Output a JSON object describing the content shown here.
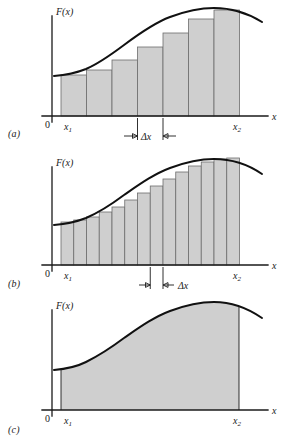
{
  "figure": {
    "background_color": "#ffffff",
    "curve_color": "#111111",
    "fill_color": "#cfcfcf",
    "bar_edge_color": "#6d6d6d",
    "axis_color": "#1a1a1a"
  },
  "labels": {
    "y_axis": "F(x)",
    "x_axis": "x",
    "origin": "0",
    "x_lower": "x",
    "x_lower_sub": "1",
    "x_upper": "x",
    "x_upper_sub": "2",
    "delta": "Δx",
    "panel_a": "(a)",
    "panel_b": "(b)",
    "panel_c": "(c)"
  },
  "panels": [
    {
      "id": "a",
      "letter": "(a)",
      "kind": "bar",
      "caption_label": "(a)",
      "bar_count": 7,
      "annotation": "Δx",
      "annotation_style": "outward-arrows-around-label",
      "note": "coarse left-endpoint rectangles under F(x)"
    },
    {
      "id": "b",
      "letter": "(b)",
      "kind": "bar",
      "caption_label": "(b)",
      "bar_count": 14,
      "annotation": "Δx",
      "annotation_style": "inward-arrows-label-right",
      "note": "finer left-endpoint rectangles under F(x)"
    },
    {
      "id": "c",
      "letter": "(c)",
      "kind": "area",
      "caption_label": "(c)",
      "bar_count": 0,
      "annotation": "",
      "annotation_style": "none",
      "note": "exact shaded area under F(x) between x1 and x2"
    }
  ],
  "chart_data": {
    "type": "area",
    "title": "",
    "xlabel": "x",
    "ylabel": "F(x)",
    "xlim": [
      0,
      1
    ],
    "ylim": [
      0,
      1
    ],
    "grid": false,
    "legend": "none",
    "x1": 0.155,
    "x2": 0.865,
    "curve_description": "smooth S-shaped rise from a low plateau to a broad maximum near x=0.80, then a slight decline",
    "curve_points_normalized": [
      {
        "x": 0.085,
        "y": 0.315
      },
      {
        "x": 0.155,
        "y": 0.32
      },
      {
        "x": 0.23,
        "y": 0.345
      },
      {
        "x": 0.3,
        "y": 0.405
      },
      {
        "x": 0.375,
        "y": 0.49
      },
      {
        "x": 0.45,
        "y": 0.585
      },
      {
        "x": 0.525,
        "y": 0.685
      },
      {
        "x": 0.6,
        "y": 0.78
      },
      {
        "x": 0.675,
        "y": 0.86
      },
      {
        "x": 0.75,
        "y": 0.915
      },
      {
        "x": 0.81,
        "y": 0.935
      },
      {
        "x": 0.865,
        "y": 0.925
      },
      {
        "x": 0.925,
        "y": 0.89
      },
      {
        "x": 0.975,
        "y": 0.845
      }
    ],
    "series": [
      {
        "name": "panel_a_rectangles",
        "type": "bar",
        "count": 7,
        "left_edges": [
          0.155,
          0.256,
          0.358,
          0.459,
          0.56,
          0.662,
          0.763
        ],
        "width": 0.1014,
        "heights": [
          0.32,
          0.365,
          0.45,
          0.57,
          0.7,
          0.83,
          0.915
        ]
      },
      {
        "name": "panel_b_rectangles",
        "type": "bar",
        "count": 14,
        "width": 0.0507,
        "left_edges": [
          0.155,
          0.206,
          0.256,
          0.307,
          0.358,
          0.408,
          0.459,
          0.51,
          0.56,
          0.611,
          0.662,
          0.712,
          0.763,
          0.814
        ],
        "heights": [
          0.32,
          0.336,
          0.365,
          0.404,
          0.45,
          0.508,
          0.57,
          0.636,
          0.7,
          0.768,
          0.83,
          0.878,
          0.915,
          0.932
        ]
      },
      {
        "name": "panel_c_exact_area",
        "type": "area",
        "count": 1,
        "from": 0.155,
        "to": 0.865
      }
    ]
  }
}
